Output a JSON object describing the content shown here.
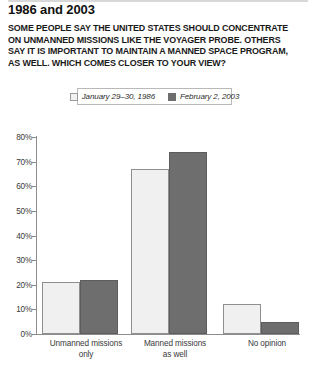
{
  "header": {
    "title": "1986 and 2003",
    "question": "SOME PEOPLE SAY THE UNITED STATES SHOULD CONCENTRATE ON UNMANNED MISSIONS LIKE THE VOYAGER PROBE. OTHERS SAY IT IS IMPORTANT TO MAINTAIN A MANNED SPACE PROGRAM, AS WELL. WHICH COMES CLOSER TO YOUR VIEW?"
  },
  "legend": {
    "items": [
      {
        "label": "January 29–30, 1986",
        "swatch": "light",
        "color": "#f2f2f2"
      },
      {
        "label": "February 2, 2003",
        "swatch": "dark",
        "color": "#6e6e6e"
      }
    ]
  },
  "axis": {
    "y_ticks": [
      "80%",
      "70%",
      "60%",
      "50%",
      "40%",
      "30%",
      "20%",
      "10%",
      "0%"
    ]
  },
  "chart_data": {
    "type": "bar",
    "title": "1986 and 2003",
    "subtitle": "SOME PEOPLE SAY THE UNITED STATES SHOULD CONCENTRATE ON UNMANNED MISSIONS LIKE THE VOYAGER PROBE. OTHERS SAY IT IS IMPORTANT TO MAINTAIN A MANNED SPACE PROGRAM, AS WELL. WHICH COMES CLOSER TO YOUR VIEW?",
    "categories": [
      "Unmanned missions only",
      "Manned missions as well",
      "No opinion"
    ],
    "category_lines": [
      [
        "Unmanned missions",
        "only"
      ],
      [
        "Manned missions",
        "as well"
      ],
      [
        "No opinion",
        ""
      ]
    ],
    "series": [
      {
        "name": "January 29–30, 1986",
        "values": [
          21,
          67,
          12
        ],
        "color": "#f0f0f0"
      },
      {
        "name": "February 2, 2003",
        "values": [
          22,
          74,
          5
        ],
        "color": "#6e6e6e"
      }
    ],
    "xlabel": "",
    "ylabel": "",
    "ylim": [
      0,
      80
    ],
    "ytick_step": 10,
    "grid": false,
    "legend_position": "top-center",
    "value_unit": "percent"
  }
}
